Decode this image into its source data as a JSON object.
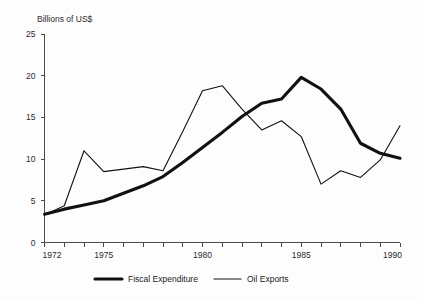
{
  "chart_data": {
    "type": "line",
    "title": "",
    "subtitle": "",
    "xlabel": "",
    "ylabel": "Billions of US$",
    "ylim": [
      0,
      25
    ],
    "xlim": [
      1972,
      1990
    ],
    "grid": false,
    "legend_position": "bottom",
    "y_ticks": [
      0,
      5,
      10,
      15,
      20,
      25
    ],
    "y_tick_labels": [
      "0",
      "5",
      "10",
      "15",
      "20",
      "25"
    ],
    "x_ticks": [
      1972,
      1973,
      1974,
      1975,
      1976,
      1977,
      1978,
      1979,
      1980,
      1981,
      1982,
      1983,
      1984,
      1985,
      1986,
      1987,
      1988,
      1989,
      1990
    ],
    "x_tick_labels_shown": [
      "1972",
      "1975",
      "1980",
      "1985",
      "1990"
    ],
    "x_labeled_years": [
      1972,
      1975,
      1980,
      1985,
      1990
    ],
    "x": [
      1972,
      1973,
      1974,
      1975,
      1976,
      1977,
      1978,
      1979,
      1980,
      1981,
      1982,
      1983,
      1984,
      1985,
      1986,
      1987,
      1988,
      1989,
      1990
    ],
    "series": [
      {
        "name": "Fiscal Expenditure",
        "style": "thick",
        "color": "#111111",
        "values": [
          3.4,
          4.0,
          4.5,
          5.0,
          5.9,
          6.8,
          7.9,
          9.6,
          11.4,
          13.2,
          15.1,
          16.7,
          17.2,
          19.8,
          18.4,
          16.0,
          11.9,
          10.7,
          10.1
        ]
      },
      {
        "name": "Oil Exports",
        "style": "thin",
        "color": "#111111",
        "values": [
          3.3,
          4.4,
          11.0,
          8.5,
          8.8,
          9.1,
          8.6,
          13.3,
          18.2,
          18.8,
          16.0,
          13.5,
          14.6,
          12.7,
          7.0,
          8.6,
          7.8,
          9.9,
          14.0
        ]
      }
    ]
  },
  "axis": {
    "y_title": "Billions of US$"
  },
  "legend": {
    "items": [
      {
        "label": "Fiscal Expenditure",
        "swatch": "thick-line-swatch"
      },
      {
        "label": "Oil Exports",
        "swatch": "thin-line-swatch"
      }
    ]
  }
}
